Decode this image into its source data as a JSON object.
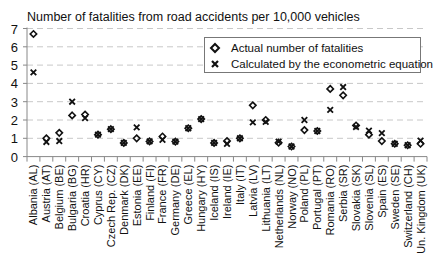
{
  "chart_data": {
    "type": "scatter",
    "title": "Number of fatalities from road accidents per 10,000 vehicles",
    "xlabel": "",
    "ylabel": "",
    "ylim": [
      0,
      7
    ],
    "yticks": [
      0,
      1,
      2,
      3,
      4,
      5,
      6,
      7
    ],
    "grid": "horizontal dashed",
    "legend_position": "upper right",
    "categories": [
      "Albania (AL)",
      "Austria (AT)",
      "Belgium (BE)",
      "Bulgaria (BG)",
      "Croatia (HR)",
      "Cyprus (CY)",
      "Czech Rep. (CZ)",
      "Denmark (DK)",
      "Estonia (EE)",
      "Finland (FI)",
      "France (FR)",
      "Germany (DE)",
      "Greece (EL)",
      "Hungary (HY)",
      "Iceland (IS)",
      "Ireland (IE)",
      "Italy (IT)",
      "Latvia (LV)",
      "Lithuania (LT)",
      "Netherlands (NL)",
      "Norway (NO)",
      "Poland (PL)",
      "Portugal (PT)",
      "Romania (RO)",
      "Serbia (SR)",
      "Slovakia (SK)",
      "Slovenia (SL)",
      "Spain (ES)",
      "Sweden (SE)",
      "Switzerland (CH)",
      "Un. Kingdom (UK)"
    ],
    "series": [
      {
        "name": "Actual number of fatalities",
        "marker": "diamond",
        "values": [
          6.7,
          1.0,
          1.3,
          2.25,
          2.3,
          1.2,
          1.5,
          0.75,
          1.0,
          0.83,
          1.1,
          0.82,
          1.55,
          2.05,
          0.75,
          0.85,
          1.0,
          2.8,
          2.0,
          0.76,
          0.55,
          1.45,
          1.4,
          3.7,
          3.35,
          1.7,
          1.2,
          0.85,
          0.7,
          0.62,
          0.7
        ]
      },
      {
        "name": "Calculated by the econometric equation",
        "marker": "x",
        "values": [
          4.6,
          0.8,
          0.85,
          3.0,
          2.1,
          1.2,
          1.5,
          0.75,
          1.6,
          0.83,
          0.92,
          0.82,
          1.55,
          2.05,
          0.75,
          0.7,
          1.0,
          1.87,
          1.9,
          0.82,
          0.55,
          2.0,
          1.4,
          2.55,
          3.8,
          1.62,
          1.42,
          1.28,
          0.7,
          0.62,
          0.87
        ]
      }
    ]
  },
  "legend": {
    "actual_label": "Actual number of fatalities",
    "calculated_label": "Calculated by the econometric equation"
  }
}
